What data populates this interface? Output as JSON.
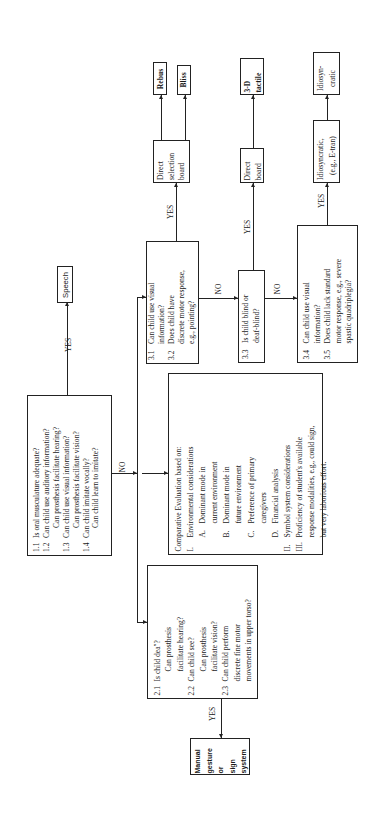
{
  "diagram": {
    "orientation": "rotated 90deg counter-clockwise",
    "labels": {
      "yes": "YES",
      "no": "NO"
    },
    "box1": {
      "items": [
        {
          "num": "1.1",
          "text": "Is oral musculature adequate?"
        },
        {
          "num": "1.2",
          "text": "Can child use auditory information?"
        },
        {
          "num": "",
          "text": "Can prosthesis facilitate hearing?"
        },
        {
          "num": "1.3",
          "text": "Can child use visual information?"
        },
        {
          "num": "",
          "text": "Can prosthesis facilitate vision?"
        },
        {
          "num": "1.4",
          "text": "Can child imitate vocally?"
        },
        {
          "num": "",
          "text": "Can child learn to imitate?"
        }
      ]
    },
    "speech": {
      "label": "Speech"
    },
    "box2": {
      "items": [
        {
          "num": "2.1",
          "text": "Is child dea\"?"
        },
        {
          "num": "",
          "text": "Can prosthesis"
        },
        {
          "num": "",
          "text": "facilitate hearing?"
        },
        {
          "num": "2.2",
          "text": "Can child see?"
        },
        {
          "num": "",
          "text": "Can prosthesis"
        },
        {
          "num": "",
          "text": "facilitate vision?"
        },
        {
          "num": "2.3",
          "text": "Can child perform"
        },
        {
          "num": "",
          "text": "discrete fine motor"
        },
        {
          "num": "",
          "text": "movements in upper torso?"
        }
      ]
    },
    "manual": {
      "lines": [
        "Manual",
        "gesture",
        "or",
        "sign",
        "system"
      ]
    },
    "comparative": {
      "title": "Comparative Evaluation based on:",
      "items": [
        {
          "num": "I.",
          "text": "Environmental considerations",
          "level": 0
        },
        {
          "num": "A.",
          "text": "Dominant mode in",
          "level": 1
        },
        {
          "num": "",
          "text": "current environment",
          "level": 2
        },
        {
          "num": "B.",
          "text": "Dominant mode in",
          "level": 1
        },
        {
          "num": "",
          "text": "future environment",
          "level": 2
        },
        {
          "num": "C.",
          "text": "Preference of primary",
          "level": 1
        },
        {
          "num": "",
          "text": "caregivers",
          "level": 2
        },
        {
          "num": "D.",
          "text": "Financial analysis",
          "level": 1
        },
        {
          "num": "II.",
          "text": "Symbol system considerations",
          "level": 0
        },
        {
          "num": "III.",
          "text": "Proficiency of student's available",
          "level": 0
        },
        {
          "num": "",
          "text": "response modalities, e.g., could sign,",
          "level": 3
        },
        {
          "num": "",
          "text": "but very laborious effort.",
          "level": 3
        }
      ]
    },
    "box31": {
      "items": [
        {
          "num": "3.1",
          "text": "Can child use visual"
        },
        {
          "num": "",
          "text": "information?"
        },
        {
          "num": "3.2",
          "text": "Does child have"
        },
        {
          "num": "",
          "text": "discrete motor response,"
        },
        {
          "num": "",
          "text": "e.g., pointing?"
        }
      ]
    },
    "box33": {
      "items": [
        {
          "num": "3.3",
          "text": "Is child blind or"
        },
        {
          "num": "",
          "text": "deaf-blind?"
        }
      ]
    },
    "box34": {
      "items": [
        {
          "num": "3.4",
          "text": "Can child use visual"
        },
        {
          "num": "",
          "text": "information?"
        },
        {
          "num": "3.5",
          "text": "Does child lack standard"
        },
        {
          "num": "",
          "text": "motor response, e.g., severe"
        },
        {
          "num": "",
          "text": "spastic quadriplegia?"
        }
      ]
    },
    "direct_selection": {
      "lines": [
        "Direct",
        "selection",
        "board"
      ]
    },
    "rebus": {
      "label": "Rebus"
    },
    "bliss": {
      "label": "Bliss"
    },
    "direct_board": {
      "lines": [
        "Direct",
        "board"
      ]
    },
    "tactile": {
      "lines": [
        "3-D",
        "tactile"
      ]
    },
    "etran": {
      "lines": [
        "Idiosyncratic,",
        "(e.g., E-tran)"
      ]
    },
    "idiosyncratic": {
      "lines": [
        "Idiosyn-",
        "cratic"
      ]
    }
  }
}
